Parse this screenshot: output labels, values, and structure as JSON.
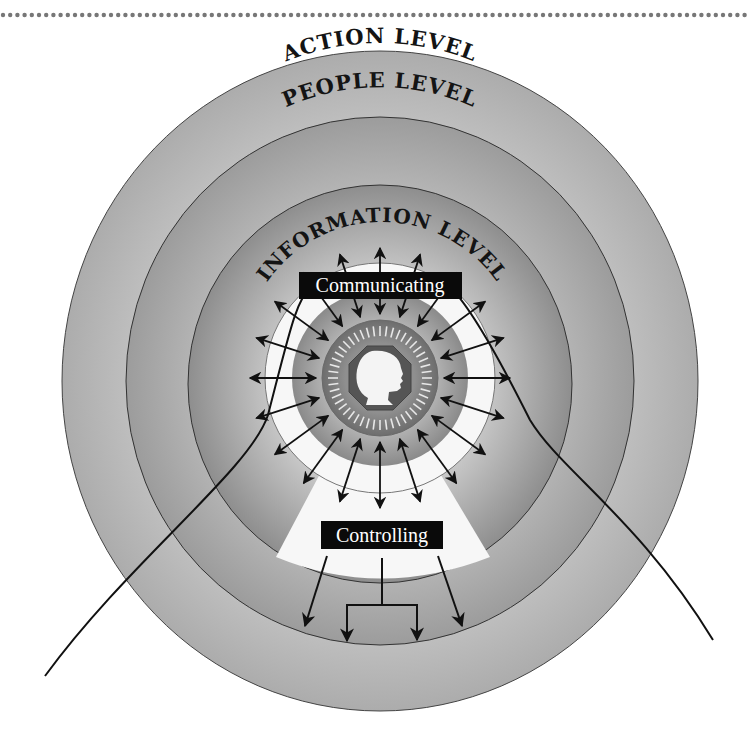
{
  "diagram": {
    "levels": [
      {
        "id": "action",
        "label": "ACTION LEVEL"
      },
      {
        "id": "people",
        "label": "PEOPLE LEVEL"
      },
      {
        "id": "information",
        "label": "INFORMATION LEVEL"
      }
    ],
    "roles": {
      "communicating": "Communicating",
      "controlling": "Controlling"
    },
    "center": {
      "icon": "person-head-profile-icon"
    },
    "radial_arrow_count": 20,
    "controlling_arrow_count": 4,
    "colors": {
      "action_ring": "#b4b4b4",
      "people_ring": "#a4a4a4",
      "information_ring": "#9a9a9a",
      "white_band": "#f7f7f7",
      "label_box": "#0a0a0a",
      "dots": "#777777",
      "stroke": "#111111"
    }
  }
}
